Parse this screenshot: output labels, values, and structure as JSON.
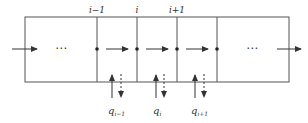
{
  "diagram": {
    "type": "segmented-channel-flow",
    "stroke_color": "#444444",
    "node_labels": [
      {
        "id": "node-i-minus-1",
        "text": "i−1",
        "x": 97
      },
      {
        "id": "node-i",
        "text": "i",
        "x": 137
      },
      {
        "id": "node-i-plus-1",
        "text": "i+1",
        "x": 177
      }
    ],
    "ellipsis_left": "⋯",
    "ellipsis_right": "⋯",
    "flows": [
      {
        "id": "q-i-minus-1",
        "symbol": "q",
        "subscript": "i−1"
      },
      {
        "id": "q-i",
        "symbol": "q",
        "subscript": "i"
      },
      {
        "id": "q-i-plus-1",
        "symbol": "q",
        "subscript": "i+1"
      }
    ]
  }
}
